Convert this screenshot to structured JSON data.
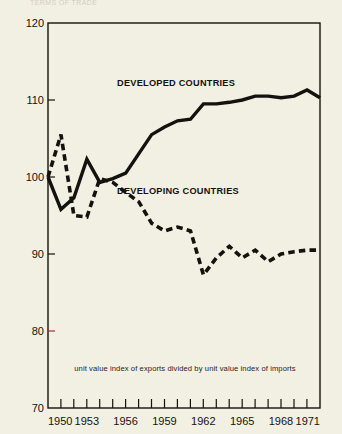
{
  "figure": {
    "name": "terms-of-trade-line-chart",
    "background_color": "#f2f0e2",
    "ink_color": "#14120e",
    "cutoff_header_text": "TERMS OF TRADE"
  },
  "caption": {
    "text": "unit value index of exports divided by unit value index of imports"
  },
  "series_labels": {
    "developed": "DEVELOPED COUNTRIES",
    "developing": "DEVELOPING COUNTRIES"
  },
  "chart_data": {
    "type": "line",
    "title": "",
    "subtitle": "",
    "xlabel": "",
    "ylabel": "",
    "xlim": [
      1950,
      1971
    ],
    "ylim": [
      70,
      120
    ],
    "grid": false,
    "legend": "inline-annotations",
    "y_ticks": [
      70,
      80,
      90,
      100,
      110,
      120
    ],
    "y_tick_labels": [
      "70",
      "80",
      "90",
      "100",
      "110",
      "120"
    ],
    "x_ticks": [
      1950,
      1951,
      1952,
      1953,
      1954,
      1955,
      1956,
      1957,
      1958,
      1959,
      1960,
      1961,
      1962,
      1963,
      1964,
      1965,
      1966,
      1967,
      1968,
      1969,
      1970,
      1971
    ],
    "x_tick_labels": [
      "1950",
      "",
      "",
      "1953",
      "",
      "",
      "1956",
      "",
      "",
      "1959",
      "",
      "",
      "1962",
      "",
      "",
      "1965",
      "",
      "",
      "1968",
      "",
      "",
      "1971"
    ],
    "x": [
      1950,
      1951,
      1952,
      1953,
      1954,
      1955,
      1956,
      1957,
      1958,
      1959,
      1960,
      1961,
      1962,
      1963,
      1964,
      1965,
      1966,
      1967,
      1968,
      1969,
      1970,
      1971
    ],
    "series": [
      {
        "name": "DEVELOPED COUNTRIES",
        "style": "solid",
        "color": "#14120e",
        "values": [
          100.0,
          95.8,
          97.3,
          102.3,
          99.3,
          99.8,
          100.5,
          103.0,
          105.5,
          106.5,
          107.3,
          107.5,
          109.5,
          109.5,
          109.7,
          110.0,
          110.5,
          110.5,
          110.3,
          110.5,
          111.3,
          110.3
        ]
      },
      {
        "name": "DEVELOPING COUNTRIES",
        "style": "dashed",
        "color": "#14120e",
        "values": [
          100.0,
          105.5,
          95.0,
          94.8,
          99.8,
          99.3,
          98.0,
          96.8,
          94.0,
          93.0,
          93.5,
          93.0,
          87.3,
          89.5,
          91.0,
          89.5,
          90.5,
          89.0,
          90.0,
          90.3,
          90.5,
          90.5
        ]
      }
    ],
    "annotations": [
      {
        "text": "DEVELOPED COUNTRIES",
        "x": 1958.5,
        "y": 113.5
      },
      {
        "text": "DEVELOPING COUNTRIES",
        "x": 1958.5,
        "y": 99.5
      },
      {
        "text": "unit value index of exports divided by unit value index of imports",
        "x": 1960.5,
        "y": 76.0
      }
    ]
  }
}
